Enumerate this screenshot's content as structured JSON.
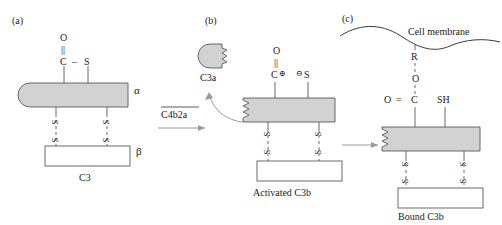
{
  "figure": {
    "colors": {
      "alpha_chain_fill": "#d2d2d2",
      "beta_chain_fill": "#ffffff",
      "stroke": "#5a5a5a",
      "text": "#1a1a1a",
      "arrow": "#9a9a9a"
    }
  },
  "panels": [
    {
      "id": "a",
      "label": "(a)",
      "caption": "C3",
      "molecule_name": "C3",
      "chains": [
        {
          "name": "alpha",
          "symbol": "α"
        },
        {
          "name": "beta",
          "symbol": "β"
        }
      ],
      "thioester": {
        "oxygen": "O",
        "double_bond": "||",
        "carbon": "C",
        "single_bond": "–",
        "sulfur": "S"
      },
      "disulfide_bonds": [
        {
          "top": "S",
          "bottom": "S"
        },
        {
          "top": "S",
          "bottom": "S"
        }
      ]
    },
    {
      "id": "b",
      "label": "(b)",
      "caption": "Activated C3b",
      "fragment_label": "C3a",
      "thioester": {
        "oxygen": "O",
        "double_bond": "||",
        "carbon_cation": "C",
        "carbon_charge": "⊕",
        "sulfur_anion_charge": "⊖",
        "sulfur": "S"
      },
      "disulfide_bonds": [
        {
          "top": "S",
          "bottom": "S"
        },
        {
          "top": "S",
          "bottom": "S"
        }
      ]
    },
    {
      "id": "c",
      "label": "(c)",
      "caption": "Bound C3b",
      "membrane_label": "Cell membrane",
      "linkage": {
        "residue": "R",
        "ester_oxygen": "O",
        "carbonyl_oxygen": "O",
        "carbonyl_bond": "=",
        "carbonyl_carbon": "C",
        "free_thiol": "SH"
      },
      "disulfide_bonds": [
        {
          "top": "S",
          "bottom": "S"
        },
        {
          "top": "S",
          "bottom": "S"
        }
      ]
    }
  ],
  "reactions": [
    {
      "id": "cleavage",
      "enzyme_label": "C4b2a",
      "enzyme_overbar": true,
      "arrow": "straight-right"
    },
    {
      "id": "release-c3a",
      "arrow": "curved-up-left"
    },
    {
      "id": "attachment",
      "arrow": "straight-right"
    }
  ]
}
